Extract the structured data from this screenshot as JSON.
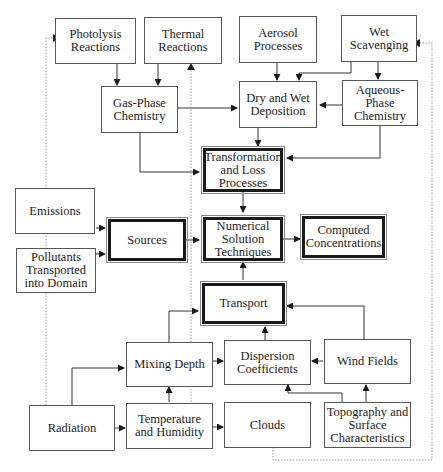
{
  "diagram": {
    "nodes": {
      "photolysis": {
        "label": "Photolysis\nReactions"
      },
      "thermal": {
        "label": "Thermal\nReactions"
      },
      "aerosol": {
        "label": "Aerosol\nProcesses"
      },
      "wet_scavenging": {
        "label": "Wet\nScavenging"
      },
      "gas_phase": {
        "label": "Gas-Phase\nChemistry"
      },
      "dry_wet_deposition": {
        "label": "Dry and Wet\nDeposition"
      },
      "aqueous_phase": {
        "label": "Aqueous-\nPhase\nChemistry"
      },
      "transformation": {
        "label": "Transformation\nand Loss\nProcesses"
      },
      "emissions": {
        "label": "Emissions"
      },
      "pollutants_transported": {
        "label": "Pollutants\nTransported\ninto Domain"
      },
      "sources": {
        "label": "Sources"
      },
      "numerical_solution": {
        "label": "Numerical\nSolution\nTechniques"
      },
      "computed_concentrations": {
        "label": "Computed\nConcentrations"
      },
      "transport": {
        "label": "Transport"
      },
      "mixing_depth": {
        "label": "Mixing Depth"
      },
      "dispersion_coefficients": {
        "label": "Dispersion\nCoefficients"
      },
      "wind_fields": {
        "label": "Wind Fields"
      },
      "radiation": {
        "label": "Radiation"
      },
      "temperature_humidity": {
        "label": "Temperature\nand Humidity"
      },
      "clouds": {
        "label": "Clouds"
      },
      "topography": {
        "label": "Topography and\nSurface\nCharacteristics"
      }
    },
    "edges": [
      {
        "from": "Photolysis Reactions",
        "to": "Gas-Phase Chemistry",
        "style": "solid"
      },
      {
        "from": "Thermal Reactions",
        "to": "Gas-Phase Chemistry",
        "style": "solid"
      },
      {
        "from": "Aerosol Processes",
        "to": "Dry and Wet Deposition",
        "style": "solid"
      },
      {
        "from": "Wet Scavenging",
        "to": "Dry and Wet Deposition",
        "style": "solid"
      },
      {
        "from": "Wet Scavenging",
        "to": "Aqueous-Phase Chemistry",
        "style": "solid"
      },
      {
        "from": "Aqueous-Phase Chemistry",
        "to": "Dry and Wet Deposition",
        "style": "solid"
      },
      {
        "from": "Gas-Phase Chemistry",
        "to": "Dry and Wet Deposition",
        "style": "solid"
      },
      {
        "from": "Gas-Phase Chemistry",
        "to": "Transformation and Loss Processes",
        "style": "solid"
      },
      {
        "from": "Dry and Wet Deposition",
        "to": "Transformation and Loss Processes",
        "style": "solid"
      },
      {
        "from": "Aqueous-Phase Chemistry",
        "to": "Transformation and Loss Processes",
        "style": "solid"
      },
      {
        "from": "Transformation and Loss Processes",
        "to": "Numerical Solution Techniques",
        "style": "solid"
      },
      {
        "from": "Emissions",
        "to": "Sources",
        "style": "solid"
      },
      {
        "from": "Pollutants Transported into Domain",
        "to": "Sources",
        "style": "solid"
      },
      {
        "from": "Sources",
        "to": "Numerical Solution Techniques",
        "style": "solid"
      },
      {
        "from": "Numerical Solution Techniques",
        "to": "Computed Concentrations",
        "style": "solid"
      },
      {
        "from": "Transport",
        "to": "Numerical Solution Techniques",
        "style": "solid"
      },
      {
        "from": "Mixing Depth",
        "to": "Transport",
        "style": "solid"
      },
      {
        "from": "Dispersion Coefficients",
        "to": "Transport",
        "style": "solid"
      },
      {
        "from": "Wind Fields",
        "to": "Transport",
        "style": "solid"
      },
      {
        "from": "Mixing Depth",
        "to": "Dispersion Coefficients",
        "style": "solid"
      },
      {
        "from": "Wind Fields",
        "to": "Dispersion Coefficients",
        "style": "solid"
      },
      {
        "from": "Radiation",
        "to": "Mixing Depth",
        "style": "solid"
      },
      {
        "from": "Radiation",
        "to": "Temperature and Humidity",
        "style": "solid"
      },
      {
        "from": "Temperature and Humidity",
        "to": "Mixing Depth",
        "style": "solid"
      },
      {
        "from": "Temperature and Humidity",
        "to": "Clouds",
        "style": "solid"
      },
      {
        "from": "Topography and Surface Characteristics",
        "to": "Dispersion Coefficients",
        "style": "solid"
      },
      {
        "from": "Topography and Surface Characteristics",
        "to": "Wind Fields",
        "style": "solid"
      },
      {
        "from": "Radiation",
        "to": "Photolysis Reactions",
        "style": "dotted"
      },
      {
        "from": "Temperature and Humidity",
        "to": "Thermal Reactions",
        "style": "dotted"
      },
      {
        "from": "Clouds",
        "to": "Wet Scavenging",
        "style": "dotted"
      }
    ],
    "colors": {
      "line": "#222222",
      "dotted": "#9a9a9a",
      "box_border": "#555555",
      "thick_border": "#1a1a1a"
    }
  }
}
